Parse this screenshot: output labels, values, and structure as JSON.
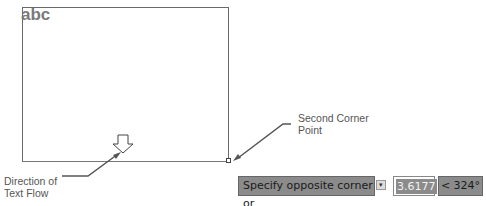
{
  "drawing": {
    "text_sample": "abc"
  },
  "annotations": {
    "second_corner": [
      "Second Corner",
      "Point"
    ],
    "text_flow": [
      "Direction of",
      "Text Flow"
    ]
  },
  "dynamic_input": {
    "prompt": "Specify opposite corner or",
    "options_icon": "down-arrow-options-icon",
    "distance_value": "3.6177",
    "angle_value": "< 324°"
  },
  "colors": {
    "tooltip_bg": "#8b8b8b",
    "frame": "#6a6a6a",
    "text_sample": "#7a7a7a"
  }
}
